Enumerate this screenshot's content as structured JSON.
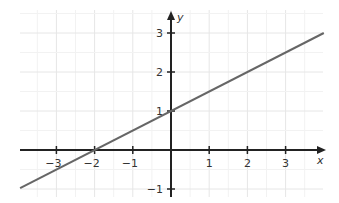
{
  "chart_data": {
    "type": "line",
    "title": "",
    "xlabel": "x",
    "ylabel": "y",
    "xlim": [
      -3.95,
      4.0
    ],
    "ylim": [
      -1.2,
      3.6
    ],
    "grid": true,
    "grid_minor_step": 0.5,
    "x_ticks": [
      -3,
      -2,
      -1,
      1,
      2,
      3
    ],
    "x_tick_labels": [
      "−3",
      "−2",
      "−1",
      "1",
      "2",
      "3"
    ],
    "y_ticks": [
      -1,
      1,
      2,
      3
    ],
    "y_tick_labels": [
      "−1",
      "1",
      "2",
      "3"
    ],
    "series": [
      {
        "name": "y = 0.5x + 1",
        "equation": "y = 0.5x + 1",
        "slope": 0.5,
        "intercept": 1,
        "x": [
          -3.95,
          4.0
        ],
        "y": [
          -0.975,
          3.0
        ],
        "color": "#666666"
      }
    ],
    "key_points": [
      {
        "label": "x-intercept",
        "x": -2,
        "y": 0
      },
      {
        "label": "y-intercept",
        "x": 0,
        "y": 1
      }
    ]
  },
  "colors": {
    "axis": "#222222",
    "grid_major": "#e6e6e6",
    "grid_minor": "#f2f2f2",
    "line": "#666666"
  }
}
